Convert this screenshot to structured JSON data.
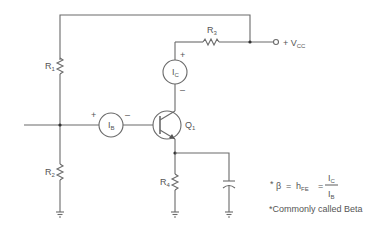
{
  "diagram": {
    "components": {
      "R1": {
        "label": "R",
        "sub": "1"
      },
      "R2": {
        "label": "R",
        "sub": "2"
      },
      "R3": {
        "label": "R",
        "sub": "3"
      },
      "R4": {
        "label": "R",
        "sub": "4"
      },
      "Q1": {
        "label": "Q",
        "sub": "1"
      },
      "IB": {
        "label": "I",
        "sub": "B",
        "plus": "+",
        "minus": "–"
      },
      "IC": {
        "label": "I",
        "sub": "C",
        "plus": "+",
        "minus": "–"
      },
      "VCC": {
        "prefix": "+ V",
        "sub": "CC"
      }
    },
    "formula": {
      "bullet": "*",
      "beta": "β",
      "eq1": "=",
      "h": "h",
      "h_sub": "FE",
      "eq2": "=",
      "numerator": "I",
      "numerator_sub": "C",
      "denominator": "I",
      "denominator_sub": "B"
    },
    "footnote": "*Commonly called Beta"
  }
}
